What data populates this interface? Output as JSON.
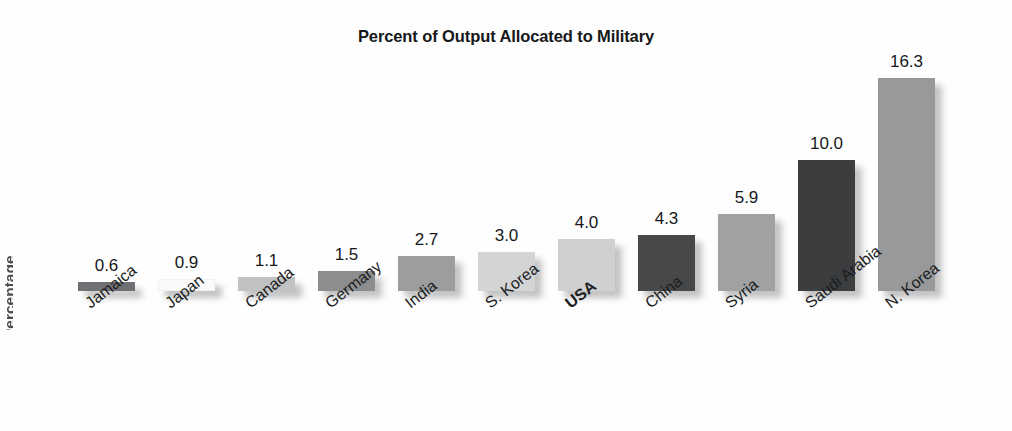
{
  "chart_data": {
    "type": "bar",
    "title": "Percent of Output Allocated to Military",
    "xlabel": "",
    "ylabel": "",
    "ylim": [
      0,
      17
    ],
    "grid": false,
    "legend": null,
    "value_labels_shown": true,
    "categories": [
      "Jamaica",
      "Japan",
      "Canada",
      "Germany",
      "India",
      "S. Korea",
      "USA",
      "China",
      "Syria",
      "Saudi Arabia",
      "N. Korea"
    ],
    "values": [
      0.6,
      0.9,
      1.1,
      1.5,
      2.7,
      3.0,
      4.0,
      4.3,
      5.9,
      10.0,
      16.3
    ],
    "value_label_text": [
      "0.6",
      "0.9",
      "1.1",
      "1.5",
      "2.7",
      "3.0",
      "4.0",
      "4.3",
      "5.9",
      "10.0",
      "16.3"
    ],
    "bar_colors": [
      "#6e7073",
      "#fafafa",
      "#c0c1c2",
      "#8b8d8f",
      "#9b9d9f",
      "#d3d4d5",
      "#cfd0d1",
      "#46484a",
      "#9fa1a3",
      "#3b3d3f",
      "#98999b"
    ],
    "emphasized_category": "USA"
  },
  "axis": {
    "ylabel_clipped": "Percentage"
  },
  "bars": [
    {
      "label": "Jamaica",
      "value": 0.6,
      "value_text": "0.6",
      "color": "#6e7073",
      "bold": false
    },
    {
      "label": "Japan",
      "value": 0.9,
      "value_text": "0.9",
      "color": "#fafafa",
      "bold": false
    },
    {
      "label": "Canada",
      "value": 1.1,
      "value_text": "1.1",
      "color": "#c0c1c2",
      "bold": false
    },
    {
      "label": "Germany",
      "value": 1.5,
      "value_text": "1.5",
      "color": "#8b8d8f",
      "bold": false
    },
    {
      "label": "India",
      "value": 2.7,
      "value_text": "2.7",
      "color": "#9b9d9f",
      "bold": false
    },
    {
      "label": "S. Korea",
      "value": 3.0,
      "value_text": "3.0",
      "color": "#d3d4d5",
      "bold": false
    },
    {
      "label": "USA",
      "value": 4.0,
      "value_text": "4.0",
      "color": "#cfd0d1",
      "bold": true
    },
    {
      "label": "China",
      "value": 4.3,
      "value_text": "4.3",
      "color": "#46484a",
      "bold": false
    },
    {
      "label": "Syria",
      "value": 5.9,
      "value_text": "5.9",
      "color": "#9fa1a3",
      "bold": false
    },
    {
      "label": "Saudi Arabia",
      "value": 10.0,
      "value_text": "10.0",
      "color": "#3b3d3f",
      "bold": false
    },
    {
      "label": "N. Korea",
      "value": 16.3,
      "value_text": "16.3",
      "color": "#98999b",
      "bold": false
    }
  ],
  "geometry": {
    "baseline_y": 291,
    "px_per_unit": 13.07,
    "bar_width": 57,
    "bar_pitch": 80,
    "first_bar_left": 78,
    "min_bar_height": 9
  }
}
